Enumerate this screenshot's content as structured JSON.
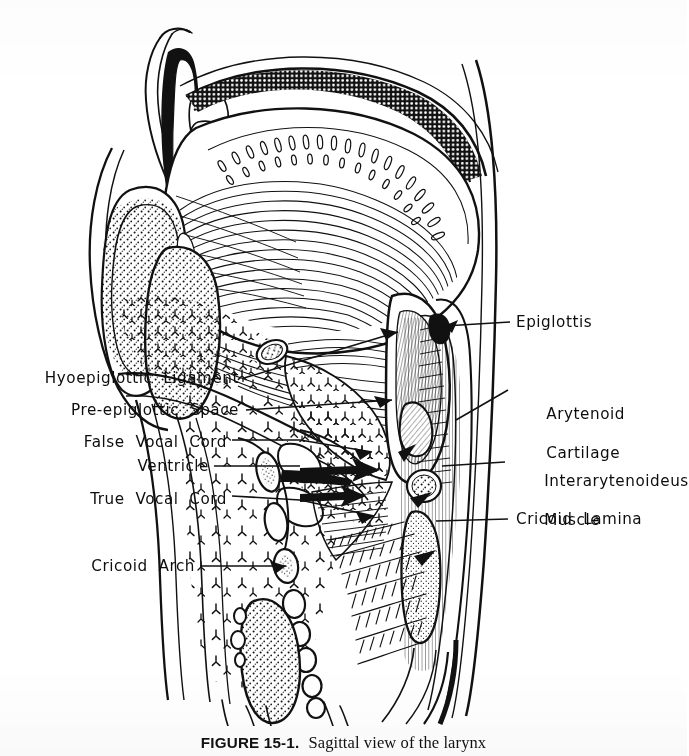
{
  "figure": {
    "type": "anatomical-line-engraving",
    "style": "black-and-white pen-and-ink hatched engraving on white paper",
    "caption_number": "FIGURE 15-1.",
    "caption_text": "Sagittal view of the larynx",
    "caption_clipped": "true",
    "ink_color": "#111111",
    "paper_color": "#ffffff"
  },
  "labels": {
    "left": [
      {
        "id": "hyoepiglottic-ligament",
        "text": "Hyoepiglottic  Ligament"
      },
      {
        "id": "pre-epiglottic-space",
        "text": "Pre-epiglottic  Space"
      },
      {
        "id": "false-vocal-cord",
        "text": "False  Vocal  Cord"
      },
      {
        "id": "ventricle",
        "text": "Ventricle"
      },
      {
        "id": "true-vocal-cord",
        "text": "True  Vocal  Cord"
      },
      {
        "id": "cricoid-arch",
        "text": "Cricoid  Arch"
      }
    ],
    "right": [
      {
        "id": "epiglottis",
        "line1": "Epiglottis",
        "line2": ""
      },
      {
        "id": "arytenoid-cartilage",
        "line1": "Arytenoid",
        "line2": "Cartilage"
      },
      {
        "id": "interarytenoideus-muscle",
        "line1": "Interarytenoideus",
        "line2": "Muscle"
      },
      {
        "id": "cricoid-lamina",
        "line1": "Cricoid  Lamina",
        "line2": ""
      }
    ]
  },
  "structures_depicted": [
    "hard palate",
    "soft palate",
    "tongue (genioglossus striations)",
    "mandible symphysis with cancellous bone",
    "hyoid bone",
    "epiglottis",
    "pre-epiglottic space",
    "thyroid cartilage",
    "false vocal cord",
    "laryngeal ventricle",
    "true vocal cord",
    "arytenoid cartilage",
    "interarytenoideus muscle",
    "cricoid arch",
    "cricoid lamina",
    "tracheal rings",
    "esophagus",
    "posterior pharyngeal wall",
    "cervical vertebral outline"
  ]
}
